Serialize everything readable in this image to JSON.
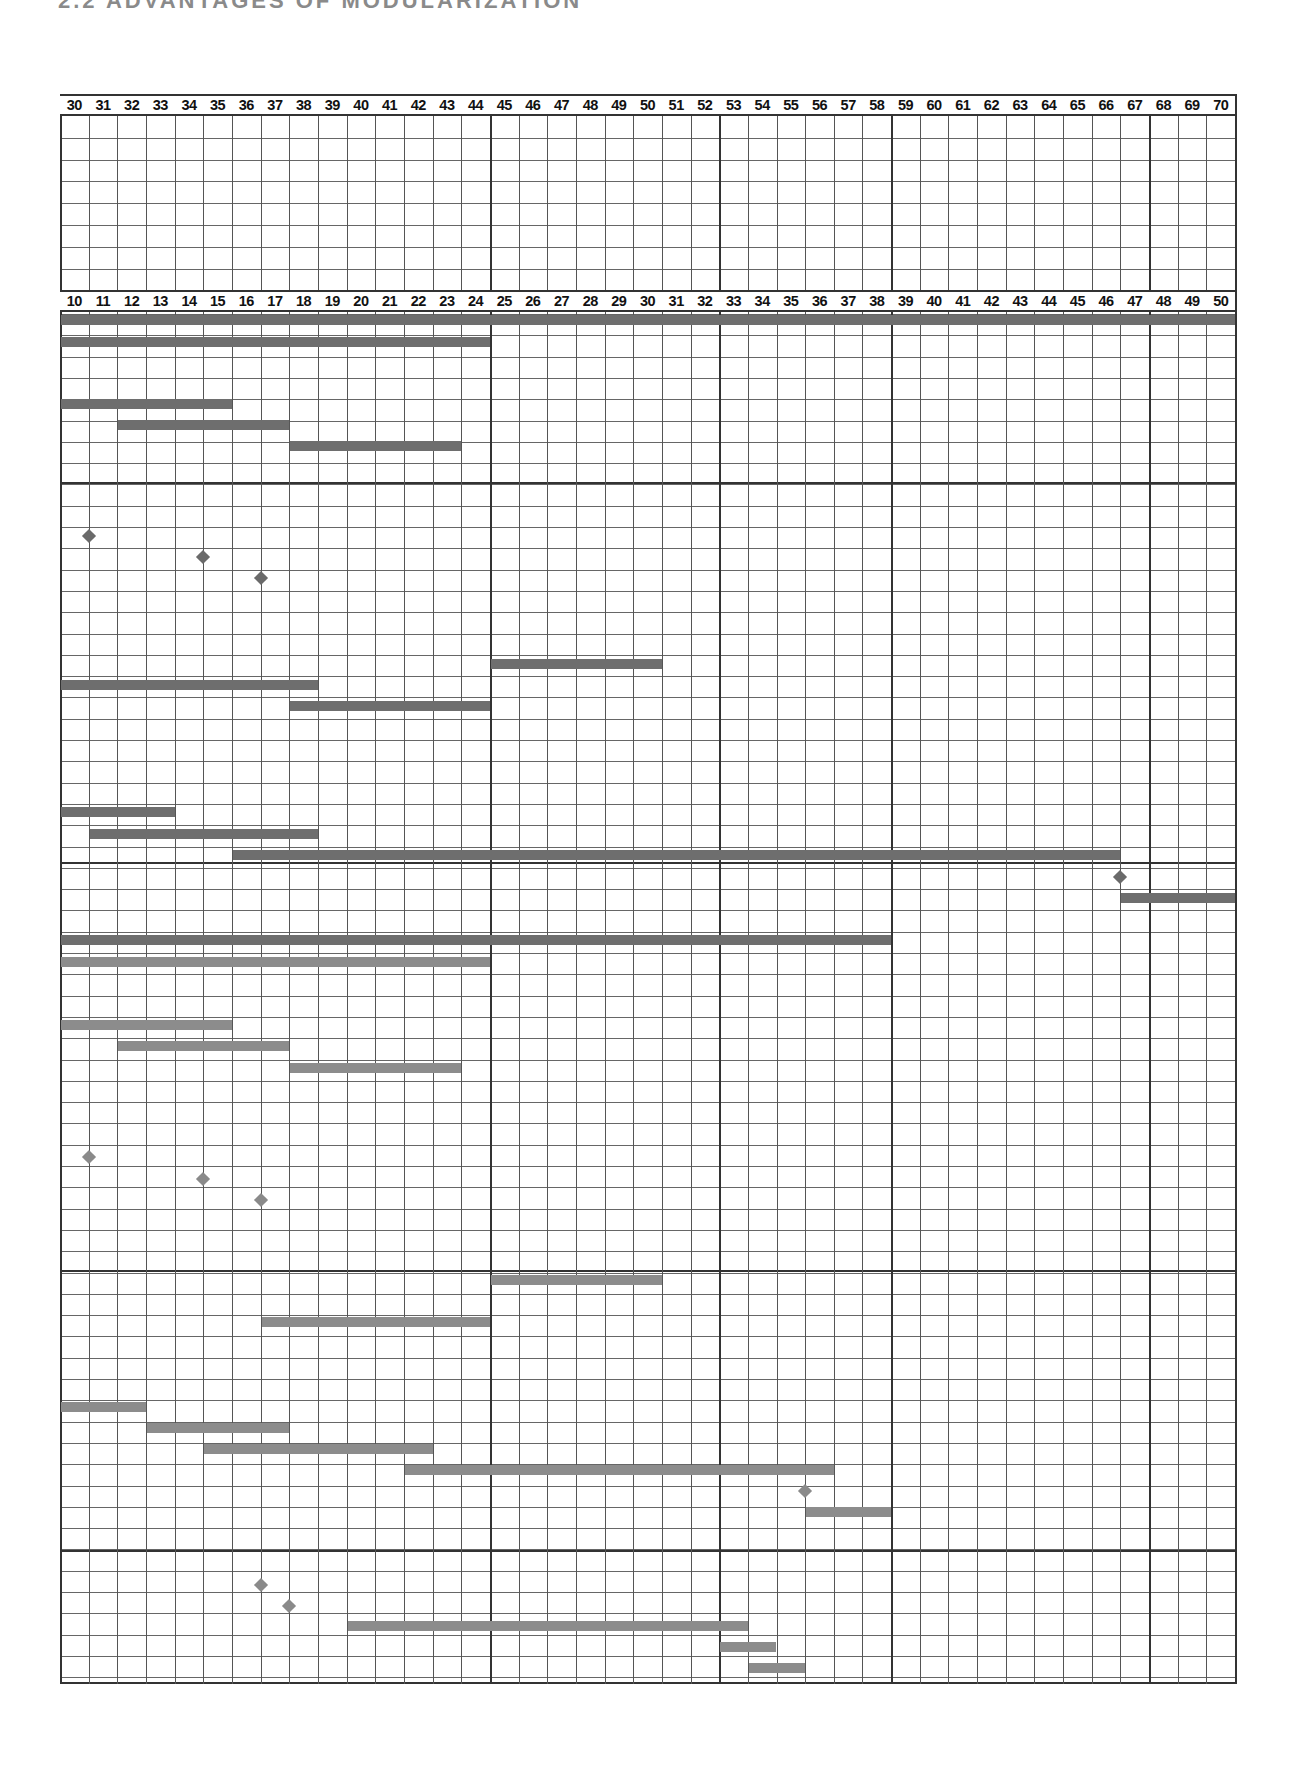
{
  "heading": "2.2 ADVANTAGES OF MODULARIZATION",
  "chart_data": {
    "type": "gantt",
    "title": "",
    "grid": true,
    "top_header": {
      "label": "Weeks (upper scale)",
      "ticks": [
        30,
        31,
        32,
        33,
        34,
        35,
        36,
        37,
        38,
        39,
        40,
        41,
        42,
        43,
        44,
        45,
        46,
        47,
        48,
        49,
        50,
        51,
        52,
        53,
        54,
        55,
        56,
        57,
        58,
        59,
        60,
        61,
        62,
        63,
        64,
        65,
        66,
        67,
        68,
        69,
        70
      ]
    },
    "bottom_header": {
      "ticks": [
        10,
        11,
        12,
        13,
        14,
        15,
        16,
        17,
        18,
        19,
        20,
        21,
        22,
        23,
        24,
        25,
        26,
        27,
        28,
        29,
        30,
        31,
        32,
        33,
        34,
        35,
        36,
        37,
        38,
        39,
        40,
        41,
        42,
        43,
        44,
        45,
        46,
        47,
        48,
        49,
        50
      ]
    },
    "major_column_dividers_after": [
      24,
      32,
      38,
      47
    ],
    "colors": {
      "bar_dark": "#6e6e6e",
      "bar_light": "#8c8c8c",
      "diamond_dark": "#6a6a6a",
      "diamond_light": "#8a8a8a",
      "grid": "#555555"
    },
    "bars": [
      {
        "y": 320,
        "start": 10,
        "end": 50,
        "tone": "dark"
      },
      {
        "y": 342,
        "start": 10,
        "end": 24,
        "tone": "dark"
      },
      {
        "y": 404,
        "start": 10,
        "end": 15,
        "tone": "dark"
      },
      {
        "y": 425,
        "start": 12,
        "end": 17,
        "tone": "dark"
      },
      {
        "y": 446,
        "start": 18,
        "end": 23,
        "tone": "dark"
      },
      {
        "y": 664,
        "start": 25,
        "end": 30,
        "tone": "dark"
      },
      {
        "y": 685,
        "start": 10,
        "end": 18,
        "tone": "dark"
      },
      {
        "y": 706,
        "start": 18,
        "end": 24,
        "tone": "dark"
      },
      {
        "y": 812,
        "start": 10,
        "end": 13,
        "tone": "dark"
      },
      {
        "y": 834,
        "start": 11,
        "end": 18,
        "tone": "dark"
      },
      {
        "y": 855,
        "start": 16,
        "end": 46,
        "tone": "dark"
      },
      {
        "y": 898,
        "start": 47,
        "end": 50,
        "tone": "dark"
      },
      {
        "y": 940,
        "start": 10,
        "end": 38,
        "tone": "dark"
      },
      {
        "y": 962,
        "start": 10,
        "end": 24,
        "tone": "light"
      },
      {
        "y": 1025,
        "start": 10,
        "end": 15,
        "tone": "light"
      },
      {
        "y": 1046,
        "start": 12,
        "end": 17,
        "tone": "light"
      },
      {
        "y": 1068,
        "start": 18,
        "end": 23,
        "tone": "light"
      },
      {
        "y": 1280,
        "start": 25,
        "end": 30,
        "tone": "light"
      },
      {
        "y": 1322,
        "start": 17,
        "end": 24,
        "tone": "light"
      },
      {
        "y": 1407,
        "start": 10,
        "end": 12,
        "tone": "light"
      },
      {
        "y": 1428,
        "start": 13,
        "end": 17,
        "tone": "light"
      },
      {
        "y": 1449,
        "start": 15,
        "end": 22,
        "tone": "light"
      },
      {
        "y": 1470,
        "start": 22,
        "end": 36,
        "tone": "light"
      },
      {
        "y": 1512,
        "start": 36,
        "end": 38,
        "tone": "light"
      },
      {
        "y": 1626,
        "start": 20,
        "end": 33,
        "tone": "light"
      },
      {
        "y": 1647,
        "start": 33,
        "end": 34,
        "tone": "light"
      },
      {
        "y": 1668,
        "start": 34,
        "end": 35,
        "tone": "light"
      }
    ],
    "milestones": [
      {
        "y": 536,
        "at": 11,
        "tone": "dark"
      },
      {
        "y": 557,
        "at": 15,
        "tone": "dark"
      },
      {
        "y": 578,
        "at": 17,
        "tone": "dark"
      },
      {
        "y": 877,
        "at": 47,
        "tone": "dark"
      },
      {
        "y": 1157,
        "at": 11,
        "tone": "light"
      },
      {
        "y": 1179,
        "at": 15,
        "tone": "light"
      },
      {
        "y": 1200,
        "at": 17,
        "tone": "light"
      },
      {
        "y": 1491,
        "at": 36,
        "tone": "light"
      },
      {
        "y": 1585,
        "at": 17,
        "tone": "light"
      },
      {
        "y": 1606,
        "at": 18,
        "tone": "light"
      }
    ]
  }
}
